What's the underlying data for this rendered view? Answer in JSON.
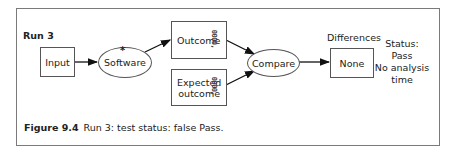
{
  "diagram": {
    "run_label": "Run 3",
    "nodes": {
      "input": "Input",
      "software": "Software",
      "software_marker": "*",
      "outcome": "Outcome",
      "expected_line1": "Expected",
      "expected_line2": "outcome",
      "compare": "Compare",
      "differences_label": "Differences",
      "none": "None",
      "data_glyph": "0000,"
    },
    "status": {
      "line1": "Status:",
      "line2": "Pass",
      "line3": "No analysis",
      "line4": "time"
    },
    "edges": [
      {
        "from": "Input",
        "to": "Software"
      },
      {
        "from": "Software",
        "to": "Outcome"
      },
      {
        "from": "Outcome",
        "to": "Compare"
      },
      {
        "from": "Expected outcome",
        "to": "Compare"
      },
      {
        "from": "Compare",
        "to": "None"
      }
    ]
  },
  "caption": {
    "figure_number": "Figure 9.4",
    "text": "Run 3: test status: false Pass."
  }
}
